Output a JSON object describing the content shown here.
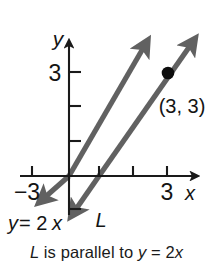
{
  "figure": {
    "type": "coordinate-graph",
    "axes": {
      "x_axis_label": "x",
      "y_axis_label": "y",
      "x_ticks_labeled": [
        "-3",
        "3"
      ],
      "y_ticks_labeled": [
        "3"
      ],
      "x_tick_neg3": "−3",
      "x_tick_pos3": "3",
      "y_tick_pos3": "3"
    },
    "lines": [
      {
        "name": "y = 2x",
        "label": "y = 2x",
        "label_parts": {
          "y": "y",
          "eq": "= 2",
          "x": "x"
        },
        "color": "#616161",
        "slope": 2,
        "intercept": 0
      },
      {
        "name": "L",
        "label": "L",
        "color": "#616161",
        "slope": 2,
        "intercept": -2
      }
    ],
    "point": {
      "label": "(3, 3)",
      "x": 3,
      "y": 3,
      "color": "#0d0d0d"
    }
  },
  "caption": {
    "full_text": "L is parallel to y = 2x",
    "line_name": "L",
    "middle": " is parallel to ",
    "eq_y": "y",
    "eq_mid": " = 2",
    "eq_x": "x"
  },
  "colors": {
    "background": "#ffffff",
    "axis": "#1a1a1a",
    "line": "#616161",
    "point": "#0d0d0d",
    "text": "#141414"
  }
}
